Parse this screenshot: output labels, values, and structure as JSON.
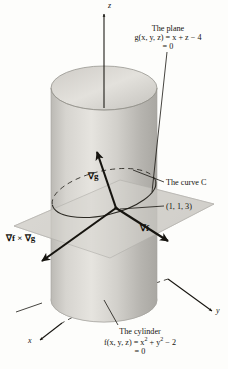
{
  "figure": {
    "title_hidden": "Cylinder and plane intersection with gradient vectors",
    "background_color": "#fdfdfb",
    "ink_color": "#16140f",
    "surface_gray": "#c9c7c2",
    "plane_gray": "#d8d6d1"
  },
  "axes": {
    "z_label": "z",
    "y_label": "y",
    "x_label": "x"
  },
  "vectors": {
    "grad_g": "∇g",
    "grad_f": "∇f",
    "cross": "∇f × ∇g"
  },
  "annotations": {
    "plane": {
      "title": "The plane",
      "equation": "g(x, y, z) = x + z − 4",
      "equals_zero": "= 0"
    },
    "cylinder": {
      "title": "The cylinder",
      "equation_prefix": "f(x, y, z) = x",
      "equation_sup1": "2",
      "equation_mid": " + y",
      "equation_sup2": "2",
      "equation_suffix": " − 2",
      "equals_zero": "= 0"
    },
    "curve": "The curve C",
    "point": "(1, 1, 3)"
  }
}
